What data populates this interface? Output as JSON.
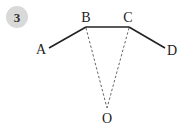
{
  "badge": {
    "number": "3",
    "fill": "#d9d9d9",
    "text_color": "#333333"
  },
  "figure": {
    "points": {
      "A": {
        "label": "A",
        "x": 49,
        "y": 48
      },
      "B": {
        "label": "B",
        "x": 86,
        "y": 27
      },
      "C": {
        "label": "C",
        "x": 129,
        "y": 27
      },
      "D": {
        "label": "D",
        "x": 165,
        "y": 48
      },
      "O": {
        "label": "O",
        "x": 107,
        "y": 108
      }
    },
    "solid_segments": [
      "AB",
      "BC",
      "CD"
    ],
    "dashed_segments": [
      "BO",
      "CO"
    ],
    "line_color": "#222222",
    "dashed_color": "#666666"
  }
}
